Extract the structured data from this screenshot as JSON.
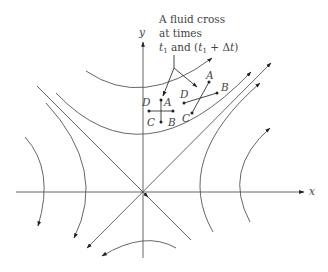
{
  "diagram": {
    "axes": {
      "x_label": "x",
      "y_label": "y"
    },
    "annotation": {
      "line1": "A fluid cross",
      "line2": "at times",
      "line3_t1": "t",
      "line3_sub1": "1",
      "line3_and": " and (",
      "line3_t2": "t",
      "line3_sub2": "1",
      "line3_plus": " + Δ",
      "line3_t3": "t",
      "line3_close": ")"
    },
    "cross_initial": {
      "labels": {
        "A": "A",
        "B": "B",
        "C": "C",
        "D": "D"
      }
    },
    "cross_later": {
      "labels": {
        "A": "A",
        "B": "B",
        "C": "C",
        "D": "D"
      }
    },
    "colors": {
      "line": "#555555",
      "text": "#444444",
      "background": "#ffffff"
    }
  }
}
